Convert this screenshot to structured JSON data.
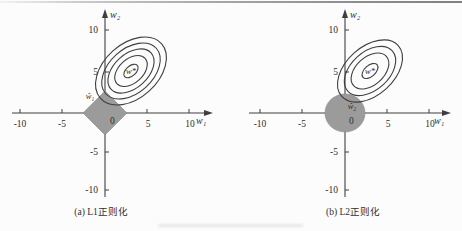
{
  "colors": {
    "constraint_fill": "#9b9b9b",
    "line": "#3f3f3f",
    "text": "#2e2e2e",
    "top_rule_gray": "#8f8f8f",
    "background": "#fcfcfc"
  },
  "figure": {
    "description_visible_text_only": true,
    "plots": [
      {
        "caption": "(a) L1正则化",
        "x_label": "w₁",
        "y_label": "w₂",
        "origin_label": "0",
        "optimum_label": "w*",
        "solution_label": "ŵ₁",
        "x_ticks": [
          "-10",
          "-5",
          "5",
          "10"
        ],
        "y_ticks": [
          "10",
          "5",
          "-5",
          "-10"
        ],
        "axis_range": [
          -10,
          10
        ],
        "constraint_region": "L1 diamond",
        "constraint_radius_units": 2.5,
        "contour_center_units": [
          3,
          5
        ],
        "contour_ring_count": 5
      },
      {
        "caption": "(b) L2正则化",
        "x_label": "w₁",
        "y_label": "w₂",
        "origin_label": "0",
        "optimum_label": "w*",
        "solution_label": "ŵ₂",
        "x_ticks": [
          "-10",
          "-5",
          "5",
          "10"
        ],
        "y_ticks": [
          "10",
          "5",
          "-5",
          "-10"
        ],
        "axis_range": [
          -10,
          10
        ],
        "constraint_region": "L2 circle",
        "constraint_radius_units": 2.4,
        "contour_center_units": [
          3,
          5
        ],
        "contour_ring_count": 4
      }
    ]
  }
}
